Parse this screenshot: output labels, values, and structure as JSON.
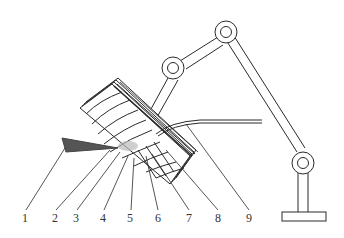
{
  "diagram": {
    "type": "technical schematic",
    "colors": {
      "stroke": "#2a2a2a",
      "background": "#ffffff",
      "shading": "#555555"
    },
    "labels": [
      {
        "id": "1",
        "text": "1",
        "x": 22,
        "y": 222
      },
      {
        "id": "2",
        "text": "2",
        "x": 52,
        "y": 222
      },
      {
        "id": "3",
        "text": "3",
        "x": 73,
        "y": 222
      },
      {
        "id": "4",
        "text": "4",
        "x": 100,
        "y": 222
      },
      {
        "id": "5",
        "text": "5",
        "x": 127,
        "y": 222
      },
      {
        "id": "6",
        "text": "6",
        "x": 155,
        "y": 222
      },
      {
        "id": "7",
        "text": "7",
        "x": 186,
        "y": 222
      },
      {
        "id": "8",
        "text": "8",
        "x": 215,
        "y": 222
      },
      {
        "id": "9",
        "text": "9",
        "x": 246,
        "y": 222
      }
    ],
    "components": {
      "robot_joints": 3,
      "base": "T-shaped pedestal",
      "workpiece": "stacked curved blades",
      "tool": "wedge-shaped shaded nozzle"
    }
  }
}
